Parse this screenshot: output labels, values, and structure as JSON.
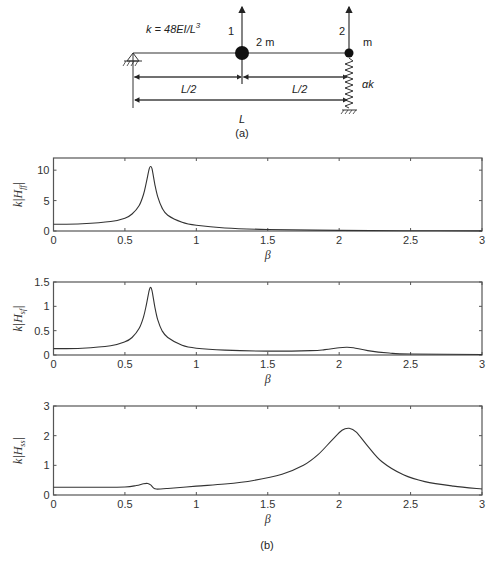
{
  "diagram": {
    "stiffness_formula": "k = 48EI/L",
    "stiffness_exp": "3",
    "dof1_label": "1",
    "dof2_label": "2",
    "mass1_label": "2 m",
    "mass2_label": "m",
    "spring_label": "αk",
    "half_span_left": "L/2",
    "half_span_right": "L/2",
    "span_label": "L",
    "caption": "(a)"
  },
  "figure_caption": "(b)",
  "chart_data": [
    {
      "type": "line",
      "ylabel": "k|H_ff|",
      "ylabel_main": "k",
      "ylabel_sub": "ff",
      "xlabel": "β",
      "xlim": [
        0,
        3
      ],
      "ylim": [
        0,
        12
      ],
      "xticks": [
        "0",
        "0.5",
        "1",
        "1.5",
        "2",
        "2.5",
        "3"
      ],
      "yticks": [
        "0",
        "5",
        "10"
      ],
      "ytick_values": [
        0,
        5,
        10
      ],
      "grid": false,
      "x": [
        0,
        0.2,
        0.4,
        0.5,
        0.55,
        0.6,
        0.63,
        0.65,
        0.67,
        0.68,
        0.69,
        0.71,
        0.73,
        0.76,
        0.8,
        0.9,
        1.0,
        1.2,
        1.5,
        2.0,
        2.5,
        3.0
      ],
      "values": [
        1.1,
        1.2,
        1.55,
        2.1,
        2.8,
        4.2,
        6.0,
        8.0,
        10.2,
        10.6,
        10.2,
        7.6,
        5.6,
        3.8,
        2.6,
        1.45,
        0.95,
        0.5,
        0.25,
        0.1,
        0.04,
        0.02
      ]
    },
    {
      "type": "line",
      "ylabel": "k|H_sf|",
      "ylabel_main": "k",
      "ylabel_sub": "sf",
      "xlabel": "β",
      "xlim": [
        0,
        3
      ],
      "ylim": [
        0,
        1.5
      ],
      "xticks": [
        "0",
        "0.5",
        "1",
        "1.5",
        "2",
        "2.5",
        "3"
      ],
      "yticks": [
        "0",
        "0.5",
        "1",
        "1.5"
      ],
      "ytick_values": [
        0,
        0.5,
        1,
        1.5
      ],
      "grid": false,
      "x": [
        0,
        0.2,
        0.4,
        0.5,
        0.55,
        0.6,
        0.63,
        0.65,
        0.67,
        0.68,
        0.69,
        0.71,
        0.73,
        0.76,
        0.8,
        0.9,
        1.0,
        1.2,
        1.5,
        1.8,
        1.9,
        2.0,
        2.05,
        2.1,
        2.2,
        2.35,
        2.5,
        3.0
      ],
      "values": [
        0.13,
        0.14,
        0.19,
        0.27,
        0.36,
        0.55,
        0.78,
        1.03,
        1.33,
        1.39,
        1.32,
        0.98,
        0.72,
        0.5,
        0.36,
        0.2,
        0.14,
        0.1,
        0.08,
        0.09,
        0.11,
        0.15,
        0.16,
        0.15,
        0.09,
        0.04,
        0.02,
        0.01
      ]
    },
    {
      "type": "line",
      "ylabel": "k|H_ss|",
      "ylabel_main": "k",
      "ylabel_sub": "ss",
      "xlabel": "β",
      "xlim": [
        0,
        3
      ],
      "ylim": [
        0,
        3
      ],
      "xticks": [
        "0",
        "0.5",
        "1",
        "1.5",
        "2",
        "2.5",
        "3"
      ],
      "yticks": [
        "0",
        "1",
        "2",
        "3"
      ],
      "ytick_values": [
        0,
        1,
        2,
        3
      ],
      "grid": false,
      "x": [
        0,
        0.3,
        0.5,
        0.58,
        0.63,
        0.66,
        0.68,
        0.7,
        0.72,
        0.8,
        1.0,
        1.2,
        1.4,
        1.6,
        1.75,
        1.85,
        1.95,
        2.02,
        2.07,
        2.12,
        2.2,
        2.3,
        2.45,
        2.6,
        2.8,
        3.0
      ],
      "values": [
        0.26,
        0.26,
        0.27,
        0.32,
        0.38,
        0.39,
        0.34,
        0.24,
        0.2,
        0.22,
        0.3,
        0.37,
        0.49,
        0.7,
        1.0,
        1.35,
        1.85,
        2.18,
        2.25,
        2.12,
        1.65,
        1.12,
        0.68,
        0.45,
        0.3,
        0.2
      ]
    }
  ]
}
